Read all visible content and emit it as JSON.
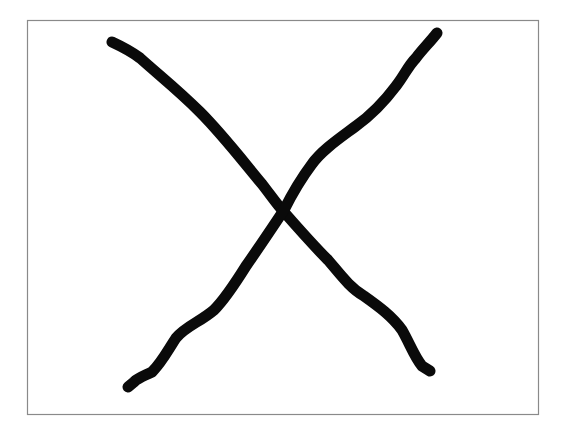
{
  "drawing": {
    "description": "Hand-drawn X mark inside a bordered box",
    "shape": "x-mark",
    "stroke_count": 2,
    "colors": {
      "background": "#ffffff",
      "frame_border": "#8a8a8a",
      "ink": "#0a0a0a"
    }
  }
}
